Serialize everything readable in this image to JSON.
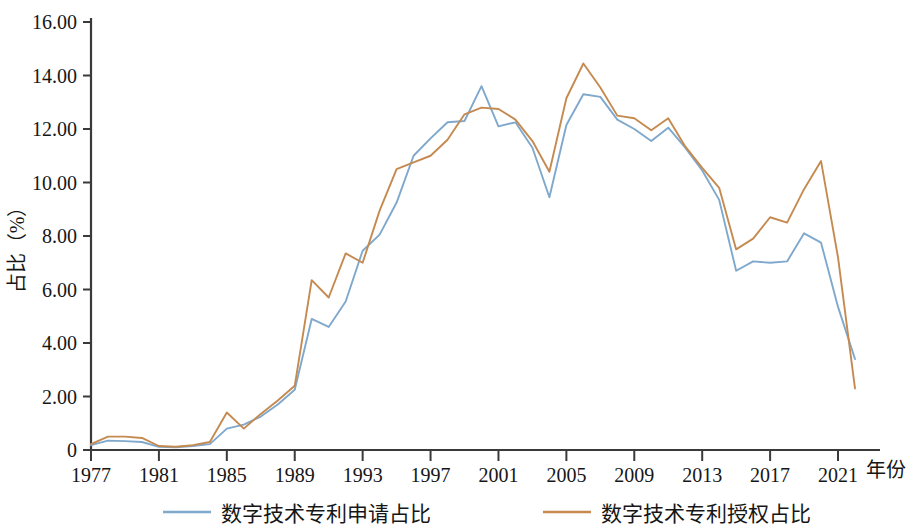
{
  "chart_data": {
    "type": "line",
    "title": "",
    "subtitle": "",
    "xlabel": "年份",
    "ylabel": "占比（%）",
    "xlim": [
      1977,
      2022
    ],
    "ylim": [
      0,
      16
    ],
    "grid": false,
    "legend_position": "bottom",
    "x": [
      1977,
      1978,
      1979,
      1980,
      1981,
      1982,
      1983,
      1984,
      1985,
      1986,
      1987,
      1988,
      1989,
      1990,
      1991,
      1992,
      1993,
      1994,
      1995,
      1996,
      1997,
      1998,
      1999,
      2000,
      2001,
      2002,
      2003,
      2004,
      2005,
      2006,
      2007,
      2008,
      2009,
      2010,
      2011,
      2012,
      2013,
      2014,
      2015,
      2016,
      2017,
      2018,
      2019,
      2020,
      2021,
      2022
    ],
    "x_ticks": [
      1977,
      1981,
      1985,
      1989,
      1993,
      1997,
      2001,
      2005,
      2009,
      2013,
      2017,
      2021
    ],
    "x_tick_labels": [
      "1977",
      "1981",
      "1985",
      "1989",
      "1993",
      "1997",
      "2001",
      "2005",
      "2009",
      "2013",
      "2017",
      "2021"
    ],
    "y_ticks": [
      0,
      2,
      4,
      6,
      8,
      10,
      12,
      14,
      16
    ],
    "y_tick_labels": [
      "0",
      "2.00",
      "4.00",
      "6.00",
      "8.00",
      "10.00",
      "12.00",
      "14.00",
      "16.00"
    ],
    "series": [
      {
        "name": "数字技术专利申请占比",
        "color": "#7FA8CD",
        "values": [
          0.18,
          0.35,
          0.33,
          0.3,
          0.12,
          0.1,
          0.15,
          0.22,
          0.8,
          0.95,
          1.25,
          1.7,
          2.25,
          4.9,
          4.6,
          5.55,
          7.45,
          8.05,
          9.25,
          11.0,
          11.65,
          12.25,
          12.3,
          13.6,
          12.1,
          12.25,
          11.3,
          9.45,
          12.15,
          13.3,
          13.2,
          12.35,
          12.0,
          11.55,
          12.05,
          11.3,
          10.45,
          9.35,
          6.7,
          7.05,
          7.0,
          7.05,
          8.1,
          7.75,
          5.35,
          3.4
        ]
      },
      {
        "name": "数字技术专利授权占比",
        "color": "#C58A50",
        "values": [
          0.22,
          0.5,
          0.5,
          0.45,
          0.15,
          0.12,
          0.18,
          0.3,
          1.4,
          0.8,
          1.35,
          1.85,
          2.4,
          6.35,
          5.7,
          7.35,
          7.0,
          8.95,
          10.5,
          10.75,
          11.0,
          11.6,
          12.55,
          12.8,
          12.75,
          12.35,
          11.55,
          10.4,
          13.15,
          14.45,
          13.55,
          12.5,
          12.4,
          11.95,
          12.4,
          11.35,
          10.55,
          9.8,
          7.5,
          7.9,
          8.7,
          8.5,
          9.75,
          10.8,
          7.2,
          2.3
        ]
      }
    ]
  },
  "axes": {
    "y_axis_title": "占比（%）",
    "x_axis_title": "年份"
  },
  "legend": {
    "items": [
      {
        "label": "数字技术专利申请占比",
        "color": "#7FA8CD"
      },
      {
        "label": "数字技术专利授权占比",
        "color": "#C58A50"
      }
    ]
  }
}
